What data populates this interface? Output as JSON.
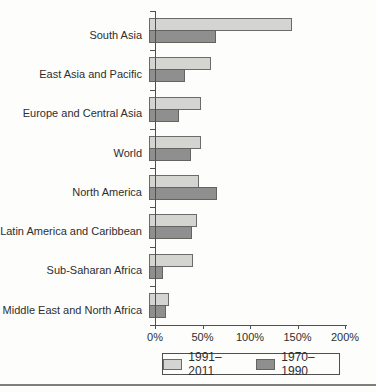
{
  "chart_data": {
    "type": "bar",
    "orientation": "horizontal",
    "title": "",
    "xlabel": "",
    "ylabel": "",
    "categories": [
      "South Asia",
      "East Asia and Pacific",
      "Europe and Central Asia",
      "World",
      "North America",
      "Latin America and Caribbean",
      "Sub-Saharan Africa",
      "Middle East and North Africa"
    ],
    "series": [
      {
        "name": "1991–2011",
        "color": "#d4d4d1",
        "border_color": "#6b6b69",
        "values": [
          150,
          65,
          55,
          55,
          53,
          50,
          46,
          21
        ]
      },
      {
        "name": "1970–1990",
        "color": "#8f8f8f",
        "border_color": "#636361",
        "values": [
          70,
          38,
          32,
          44,
          72,
          45,
          15,
          18
        ]
      }
    ],
    "x_ticks": [
      0,
      50,
      100,
      150,
      200
    ],
    "x_tick_labels": [
      "0%",
      "50%",
      "100%",
      "150%",
      "200%"
    ],
    "xlim": [
      0,
      200
    ],
    "grid": false,
    "legend_position": "bottom",
    "value_unit": "%"
  }
}
